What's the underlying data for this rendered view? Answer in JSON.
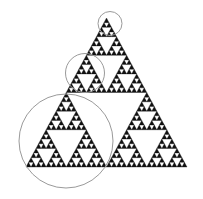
{
  "figure": {
    "background_color": "#ffffff",
    "width": 203,
    "height": 199
  },
  "chart_data": {
    "type": "diagram",
    "title": "",
    "subtitle": "",
    "xlabel": "",
    "ylabel": "",
    "grid": false,
    "legend": null,
    "annotations": [],
    "fractal": {
      "name": "Sierpinski triangle",
      "depth": 5,
      "fill_color": "#111111",
      "apex": {
        "x": 106.5,
        "y": 18
      },
      "bottom_left": {
        "x": 26,
        "y": 167
      },
      "bottom_right": {
        "x": 187,
        "y": 167
      },
      "side_length": 161
    },
    "circles": [
      {
        "label": "small-circle",
        "cx": 110,
        "cy": 23.5,
        "r": 12,
        "stroke": "#9a9a9a",
        "stroke_width": 1,
        "fill": "none"
      },
      {
        "label": "medium-circle",
        "cx": 85,
        "cy": 73,
        "r": 19.5,
        "stroke": "#9a9a9a",
        "stroke_width": 1,
        "fill": "none"
      },
      {
        "label": "large-circle",
        "cx": 66,
        "cy": 141,
        "r": 47,
        "stroke": "#9a9a9a",
        "stroke_width": 1,
        "fill": "none"
      }
    ]
  }
}
